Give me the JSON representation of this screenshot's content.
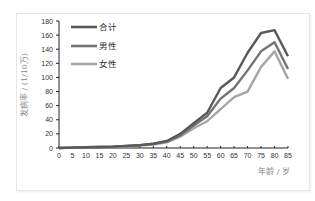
{
  "chart_data": {
    "type": "line",
    "title": "",
    "xlabel": "年龄 / 岁",
    "ylabel": "发病率 / (1/10万)",
    "x": [
      0,
      5,
      10,
      15,
      20,
      25,
      30,
      35,
      40,
      45,
      50,
      55,
      60,
      65,
      70,
      75,
      80,
      85
    ],
    "xticks": [
      "0",
      "5",
      "10",
      "15",
      "20",
      "25",
      "30",
      "35",
      "40",
      "45",
      "50",
      "55",
      "60",
      "65",
      "70",
      "75",
      "80",
      "85"
    ],
    "yticks": [
      "0",
      "20",
      "40",
      "60",
      "80",
      "100",
      "120",
      "140",
      "160",
      "180"
    ],
    "ylim": [
      0,
      180
    ],
    "grid": false,
    "legend_position": "upper-left-inside",
    "series": [
      {
        "name": "合计",
        "color": "#595959",
        "values": [
          0,
          0.5,
          1,
          1.5,
          2,
          3,
          4,
          6,
          10,
          20,
          35,
          50,
          85,
          100,
          135,
          163,
          167,
          130
        ]
      },
      {
        "name": "男性",
        "color": "#737373",
        "values": [
          0,
          0.5,
          1,
          1.5,
          2,
          3,
          4,
          6,
          9,
          18,
          32,
          45,
          70,
          85,
          110,
          137,
          150,
          112
        ]
      },
      {
        "name": "女性",
        "color": "#a6a6a6",
        "values": [
          0,
          0.5,
          1,
          1.5,
          2,
          2.5,
          3.5,
          5,
          8,
          16,
          28,
          38,
          55,
          72,
          80,
          115,
          137,
          98
        ]
      }
    ]
  }
}
